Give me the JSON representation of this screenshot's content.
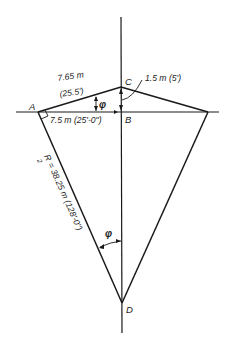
{
  "figure": {
    "type": "geometric-construction",
    "colors": {
      "line": "#1a1a1a",
      "background": "#ffffff"
    },
    "points": {
      "A": {
        "label": "A",
        "x": 38,
        "y": 112
      },
      "B": {
        "label": "B",
        "x": 121,
        "y": 112
      },
      "C": {
        "label": "C",
        "x": 121,
        "y": 87
      },
      "D": {
        "label": "D",
        "x": 122,
        "y": 303
      },
      "E": {
        "label": "",
        "x": 208,
        "y": 112
      }
    },
    "dimensions": {
      "ac_length_m": "7.65 m",
      "ac_length_ft": "(25.5')",
      "ab_length": "7.5 m (25'-0\")",
      "bc_height": "1.5 m (5')",
      "radius": "R",
      "radius_sub": "2",
      "radius_value": "= 38.25 m (128'-0\")"
    },
    "angles": {
      "phi_top": "φ",
      "phi_bottom": "φ"
    }
  }
}
